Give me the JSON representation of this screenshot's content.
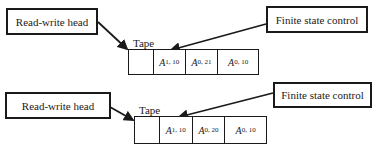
{
  "diagrams": [
    {
      "rw_head_label": "Read-write head",
      "fsc_label": "Finite state control",
      "tape_label": "Tape",
      "cells": [
        {
          "sym": "",
          "sub": "",
          "sup": ""
        },
        {
          "sym": "A",
          "sub": "1, 1",
          "sup": "0"
        },
        {
          "sym": "A",
          "sub": "0, 2",
          "sup": "1"
        },
        {
          "sym": "A",
          "sub": "0, 1",
          "sup": "0"
        }
      ]
    },
    {
      "rw_head_label": "Read-write head",
      "fsc_label": "Finite state control",
      "tape_label": "Tape",
      "cells": [
        {
          "sym": "",
          "sub": "",
          "sup": ""
        },
        {
          "sym": "A",
          "sub": "1, 1",
          "sup": "0"
        },
        {
          "sym": "A",
          "sub": "0, 2",
          "sup": "0"
        },
        {
          "sym": "A",
          "sub": "0, 1",
          "sup": "0"
        }
      ]
    }
  ],
  "colors": {
    "line": "#1a1a1a",
    "background": "#ffffff"
  }
}
